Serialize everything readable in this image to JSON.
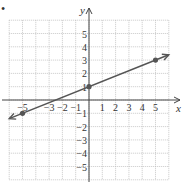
{
  "bullet": "•",
  "chart_data": {
    "type": "line",
    "title": "",
    "xlabel": "x",
    "ylabel": "y",
    "xlim": [
      -6,
      6
    ],
    "ylim": [
      -6,
      6
    ],
    "grid": true,
    "x_tick_labels": [
      "−5",
      "−3",
      "−2",
      "−1",
      "1",
      "2",
      "3",
      "4",
      "5"
    ],
    "x_ticks": [
      -5,
      -3,
      -2,
      -1,
      1,
      2,
      3,
      4,
      5
    ],
    "y_tick_labels": [
      "5",
      "4",
      "3",
      "2",
      "1",
      "−1",
      "−2",
      "−3",
      "−4",
      "−5"
    ],
    "y_ticks": [
      5,
      4,
      3,
      2,
      1,
      -1,
      -2,
      -3,
      -4,
      -5
    ],
    "series": [
      {
        "name": "line",
        "slope": 0.4,
        "intercept": 1,
        "x": [
          -6,
          6
        ],
        "y": [
          -1.4,
          3.4
        ],
        "arrows": "both"
      }
    ],
    "points": [
      {
        "x": -5,
        "y": -1
      },
      {
        "x": 0,
        "y": 1
      },
      {
        "x": 5,
        "y": 3
      }
    ],
    "colors": {
      "line": "#555555",
      "grid": "#bbbbbb",
      "axis": "#444444"
    }
  }
}
